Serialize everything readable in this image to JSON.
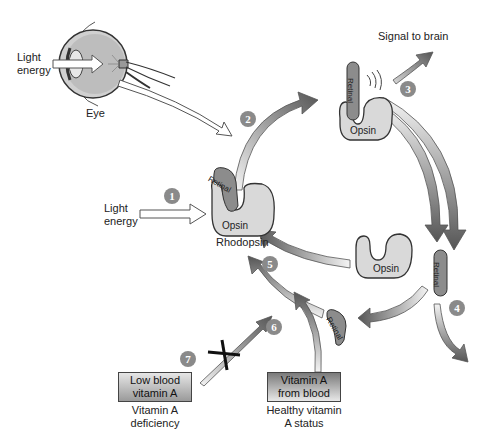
{
  "diagram": {
    "eye": {
      "label": "Eye",
      "input_label_line1": "Light",
      "input_label_line2": "energy"
    },
    "light_input": {
      "line1": "Light",
      "line2": "energy"
    },
    "rhodopsin": {
      "name": "Rhodopsin",
      "protein_label": "Opsin",
      "chromophore_label": "Retinal"
    },
    "activated": {
      "protein_label": "Opsin",
      "chromophore_label": "Retinal"
    },
    "signal": {
      "label": "Signal to brain"
    },
    "free_opsin": {
      "label": "Opsin"
    },
    "free_retinal": {
      "label": "Retinal"
    },
    "recycled_retinal": {
      "label": "Retinal"
    },
    "steps": [
      "1",
      "2",
      "3",
      "4",
      "5",
      "6",
      "7"
    ],
    "deficiency_box": {
      "line1": "Low blood",
      "line2": "vitamin A",
      "caption1": "Vitamin A",
      "caption2": "deficiency"
    },
    "healthy_box": {
      "line1": "Vitamin A",
      "line2": "from blood",
      "caption1": "Healthy vitamin",
      "caption2": "A status"
    },
    "colors": {
      "arrow_dark": "#555555",
      "arrow_light": "#f2f2f2",
      "protein_fill": "#d9d9d9",
      "retinal_fill": "#8c8c8c",
      "step_circle": "#8a8a8a",
      "block_mark": "#111111"
    }
  }
}
